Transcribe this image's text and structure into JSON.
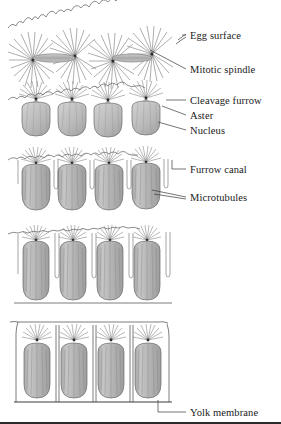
{
  "figure": {
    "background_color": "#ffffff",
    "ink_color": "#4a4a4a",
    "cell_fill_color": "#b9b9b9",
    "nucleus_fill_color": "#bdbdbd",
    "label_color": "#1a1a1a"
  },
  "labels": [
    {
      "id": "egg-surface",
      "text": "Egg surface",
      "x": 190,
      "y": 38,
      "leader": [
        [
          176,
          43
        ],
        [
          186,
          34
        ]
      ]
    },
    {
      "id": "mitotic-spindle",
      "text": "Mitotic spindle",
      "x": 190,
      "y": 72,
      "leader": [
        [
          150,
          48
        ],
        [
          186,
          69
        ]
      ]
    },
    {
      "id": "cleavage-furrow",
      "text": "Cleavage furrow",
      "x": 190,
      "y": 103,
      "leader": [
        [
          168,
          100
        ],
        [
          186,
          100
        ]
      ]
    },
    {
      "id": "aster",
      "text": "Aster",
      "x": 190,
      "y": 118,
      "leader": [
        [
          163,
          108
        ],
        [
          186,
          115
        ]
      ]
    },
    {
      "id": "nucleus",
      "text": "Nucleus",
      "x": 190,
      "y": 133,
      "leader": [
        [
          160,
          125
        ],
        [
          186,
          130
        ]
      ]
    },
    {
      "id": "furrow-canal",
      "text": "Furrow canal",
      "x": 190,
      "y": 172,
      "leader": [
        [
          163,
          165
        ],
        [
          186,
          169
        ]
      ]
    },
    {
      "id": "microtubules",
      "text": "Microtubules",
      "x": 190,
      "y": 200,
      "leader": [
        [
          152,
          192
        ],
        [
          186,
          197
        ]
      ]
    },
    {
      "id": "yolk-membrane",
      "text": "Yolk membrane",
      "x": 190,
      "y": 415,
      "leader": [
        [
          150,
          402
        ],
        [
          186,
          412
        ]
      ]
    }
  ],
  "stages": [
    {
      "id": "stage-1",
      "name": "Syncytial nuclei with mitotic spindles at egg surface",
      "top": 12,
      "height": 68,
      "nuclei": 4,
      "features": [
        "egg-surface",
        "aster",
        "mitotic-spindle"
      ]
    },
    {
      "id": "stage-2",
      "name": "Cleavage furrows begin; nuclei rounded beneath surface",
      "top": 86,
      "height": 58,
      "nuclei": 4,
      "features": [
        "cleavage-furrow",
        "aster",
        "nucleus"
      ]
    },
    {
      "id": "stage-3",
      "name": "Furrow canals descend; microtubules elongate cells",
      "top": 150,
      "height": 68,
      "nuclei": 4,
      "features": [
        "furrow-canal",
        "microtubules"
      ]
    },
    {
      "id": "stage-4",
      "name": "Cells elongate further as furrows deepen",
      "top": 224,
      "height": 84,
      "nuclei": 4,
      "features": [
        "microtubules"
      ]
    },
    {
      "id": "stage-5",
      "name": "Cellularization complete above the yolk membrane",
      "top": 314,
      "height": 96,
      "nuclei": 4,
      "features": [
        "yolk-membrane"
      ]
    }
  ]
}
